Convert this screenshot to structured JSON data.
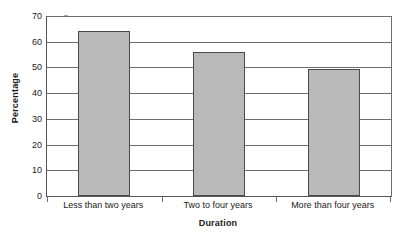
{
  "chart_data": {
    "type": "bar",
    "title": "",
    "subtitle": "",
    "xlabel": "Duration",
    "ylabel": "Percentage",
    "categories": [
      "Less than two years",
      "Two to four years",
      "More than four years"
    ],
    "values": [
      64,
      56,
      49.5
    ],
    "ylim": [
      0,
      70
    ],
    "y_ticks": [
      0,
      10,
      20,
      30,
      40,
      50,
      60,
      70
    ],
    "y_tick_labels": [
      "0",
      "10",
      "20",
      "30",
      "40",
      "50",
      "60",
      "70"
    ],
    "grid": true,
    "grid_axis": "y",
    "legend": false,
    "legend_position": "none",
    "annotations": [],
    "series": [
      {
        "name": "Percentage",
        "values": [
          64,
          56,
          49.5
        ],
        "color": "#b9b9b9",
        "border_color": "#4a4a4a"
      }
    ],
    "colors": {
      "bar_fill": "#b9b9b9",
      "bar_border": "#4a4a4a",
      "gridline": "#6e6e6e",
      "axis": "#555555",
      "text": "#1a1a1a",
      "background": "#ffffff"
    }
  }
}
